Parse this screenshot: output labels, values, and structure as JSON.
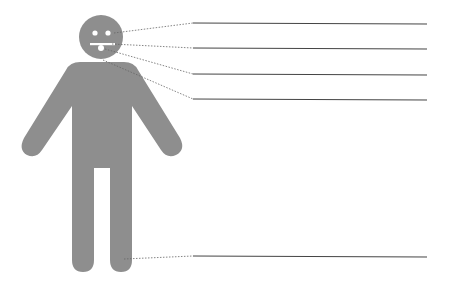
{
  "diagram": {
    "title": "",
    "figure": "human-body-outline",
    "fill_color": "#8e8e8e",
    "line_color": "#555555",
    "labels": [
      {
        "id": "eye",
        "text": "",
        "y": 23
      },
      {
        "id": "mouth",
        "text": "",
        "y": 48
      },
      {
        "id": "tongue",
        "text": "",
        "y": 74
      },
      {
        "id": "neck",
        "text": "",
        "y": 99
      },
      {
        "id": "foot",
        "text": "",
        "y": 256
      }
    ]
  }
}
